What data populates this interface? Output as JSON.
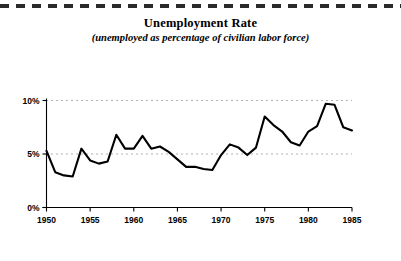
{
  "chart_data": {
    "type": "line",
    "title": "Unemployment Rate",
    "subtitle": "(unemployed as percentage of civilian labor force)",
    "xlabel": "",
    "ylabel": "",
    "xlim": [
      1950,
      1985
    ],
    "ylim": [
      0,
      10
    ],
    "grid": true,
    "legend": "none",
    "x_tick_labels": [
      "1950",
      "1955",
      "1960",
      "1965",
      "1970",
      "1975",
      "1980",
      "1985"
    ],
    "x_ticks": [
      1950,
      1955,
      1960,
      1965,
      1970,
      1975,
      1980,
      1985
    ],
    "y_tick_labels": [
      "0%",
      "5%",
      "10%"
    ],
    "y_ticks": [
      0,
      5,
      10
    ],
    "series": [
      {
        "name": "Unemployment Rate",
        "color": "#000000",
        "x": [
          1950,
          1951,
          1952,
          1953,
          1954,
          1955,
          1956,
          1957,
          1958,
          1959,
          1960,
          1961,
          1962,
          1963,
          1964,
          1965,
          1966,
          1967,
          1968,
          1969,
          1970,
          1971,
          1972,
          1973,
          1974,
          1975,
          1976,
          1977,
          1978,
          1979,
          1980,
          1981,
          1982,
          1983,
          1984,
          1985
        ],
        "values": [
          5.3,
          3.3,
          3.0,
          2.9,
          5.5,
          4.4,
          4.1,
          4.3,
          6.8,
          5.5,
          5.5,
          6.7,
          5.5,
          5.7,
          5.2,
          4.5,
          3.8,
          3.8,
          3.6,
          3.5,
          4.9,
          5.9,
          5.6,
          4.9,
          5.6,
          8.5,
          7.7,
          7.1,
          6.1,
          5.8,
          7.1,
          7.6,
          9.7,
          9.6,
          7.5,
          7.2
        ]
      }
    ]
  },
  "figure": {
    "top_rule": "dashed-rule"
  }
}
